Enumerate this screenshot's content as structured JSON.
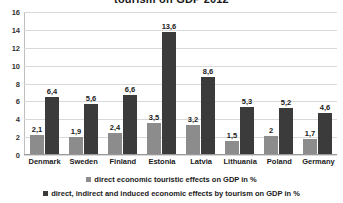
{
  "chart_data": {
    "type": "bar",
    "title": "tourism on GDP 2012",
    "xlabel": "",
    "ylabel": "",
    "ylim": [
      0,
      16
    ],
    "yticks": [
      0,
      2,
      4,
      6,
      8,
      10,
      12,
      14,
      16
    ],
    "grid": true,
    "legend_position": "bottom",
    "categories": [
      "Denmark",
      "Sweden",
      "Finland",
      "Estonia",
      "Latvia",
      "Lithuania",
      "Poland",
      "Germany"
    ],
    "series": [
      {
        "name": "direct economic touristic effects on GDP in %",
        "color": "#8c8c8c",
        "values": [
          2.1,
          1.9,
          2.4,
          3.5,
          3.2,
          1.5,
          2.0,
          1.7
        ],
        "labels": [
          "2,1",
          "1,9",
          "2,4",
          "3,5",
          "3,2",
          "1,5",
          "2",
          "1,7"
        ]
      },
      {
        "name": "direct, indirect and induced economic effects by tourism on GDP in %",
        "color": "#3b3b3b",
        "values": [
          6.4,
          5.6,
          6.6,
          13.6,
          8.6,
          5.3,
          5.2,
          4.6
        ],
        "labels": [
          "6,4",
          "5,6",
          "6,6",
          "13,6",
          "8,6",
          "5,3",
          "5,2",
          "4,6"
        ]
      }
    ]
  }
}
